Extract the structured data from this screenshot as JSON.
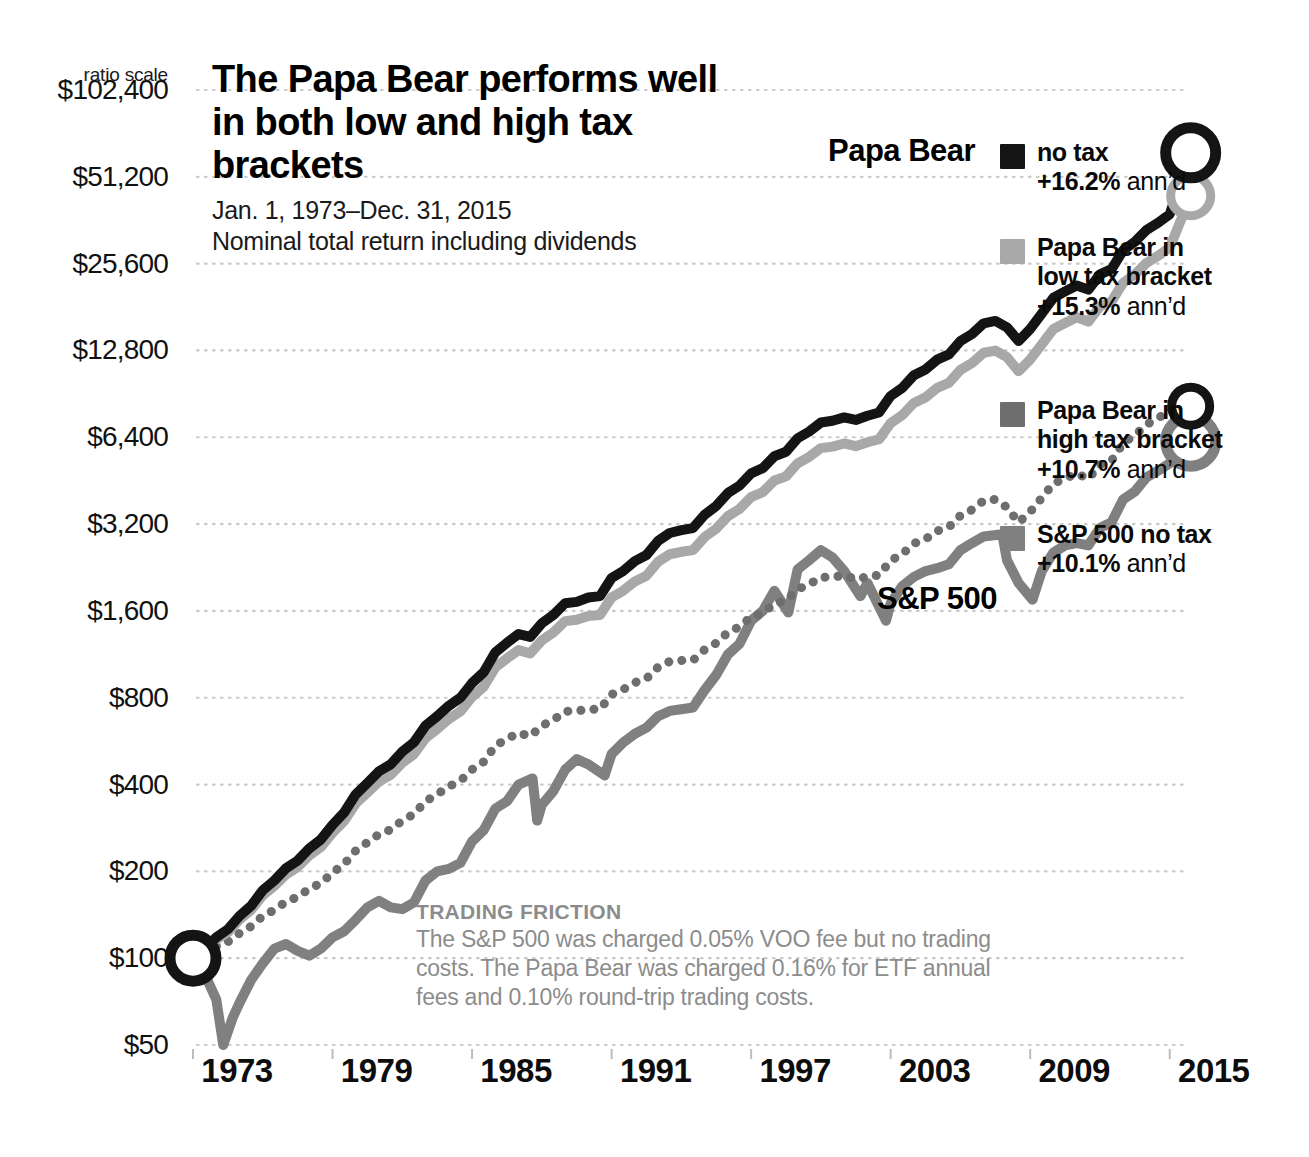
{
  "axis": {
    "ratio_scale_label": "ratio scale",
    "y_ticks": [
      "$102,400",
      "$51,200",
      "$25,600",
      "$12,800",
      "$6,400",
      "$3,200",
      "$1,600",
      "$800",
      "$400",
      "$200",
      "$100",
      "$50"
    ],
    "x_ticks": [
      "1973",
      "1979",
      "1985",
      "1991",
      "1997",
      "2003",
      "2009",
      "2015"
    ]
  },
  "headline": {
    "title": "The Papa Bear performs well in both low and high tax brackets",
    "date_range": "Jan. 1, 1973–Dec. 31, 2015",
    "subnote": "Nominal total return including dividends"
  },
  "callouts": {
    "papa_bear": "Papa Bear",
    "sp500": "S&P 500"
  },
  "legend": {
    "items": [
      {
        "line1": "no tax",
        "line2": null,
        "perf": "+16.2%",
        "ann": " ann’d",
        "color": "#141414"
      },
      {
        "line1": "Papa Bear in",
        "line2": "low tax bracket",
        "perf": "+15.3%",
        "ann": " ann’d",
        "color": "#a8a8a8"
      },
      {
        "line1": "Papa Bear in",
        "line2": "high tax bracket",
        "perf": "+10.7%",
        "ann": " ann’d",
        "color": "#6e6e6e"
      },
      {
        "line1": "S&P 500 no tax",
        "line2": null,
        "perf": "+10.1%",
        "ann": " ann’d",
        "color": "#808080"
      }
    ]
  },
  "friction": {
    "title": "TRADING FRICTION",
    "body": "The S&P 500 was charged 0.05% VOO fee but no trading costs. The Papa Bear was charged 0.16% for ETF annual fees and 0.10% round-trip trading costs."
  },
  "chart_data": {
    "type": "line",
    "title": "The Papa Bear performs well in both low and high tax brackets",
    "subtitle": "Jan. 1, 1973–Dec. 31, 2015 / Nominal total return including dividends",
    "xlabel": "",
    "ylabel": "Growth of $100 (ratio scale)",
    "scale": "log2",
    "grid": true,
    "legend_position": "right",
    "xlim": [
      1973,
      2016
    ],
    "ylim": [
      50,
      102400
    ],
    "y_tick_values": [
      102400,
      51200,
      25600,
      12800,
      6400,
      3200,
      1600,
      800,
      400,
      200,
      100,
      50
    ],
    "x_tick_values": [
      1973,
      1979,
      1985,
      1991,
      1997,
      2003,
      2009,
      2015
    ],
    "annotations": [
      {
        "text": "Papa Bear",
        "x": 2010,
        "y": 76000
      },
      {
        "text": "S&P 500",
        "x": 2009,
        "y": 2300
      },
      {
        "text": "start marker $100",
        "x": 1973,
        "y": 100
      },
      {
        "text": "end marker Papa Bear no tax",
        "x": 2016,
        "y": 62000
      },
      {
        "text": "end marker Papa Bear low tax",
        "x": 2016,
        "y": 44000
      },
      {
        "text": "end marker Papa Bear high tax",
        "x": 2016,
        "y": 8200
      },
      {
        "text": "end marker S&P 500",
        "x": 2016,
        "y": 6200
      }
    ],
    "series": [
      {
        "name": "Papa Bear no tax",
        "annualized_return_pct": 16.2,
        "color": "#141414",
        "style": "solid",
        "x": [
          1973,
          1973.5,
          1974,
          1974.5,
          1975,
          1975.5,
          1976,
          1976.5,
          1977,
          1977.5,
          1978,
          1978.5,
          1979,
          1979.5,
          1980,
          1980.5,
          1981,
          1981.5,
          1982,
          1982.5,
          1983,
          1983.5,
          1984,
          1984.5,
          1985,
          1985.5,
          1986,
          1986.5,
          1987,
          1987.5,
          1988,
          1988.5,
          1989,
          1989.5,
          1990,
          1990.5,
          1991,
          1991.5,
          1992,
          1992.5,
          1993,
          1993.5,
          1994,
          1994.5,
          1995,
          1995.5,
          1996,
          1996.5,
          1997,
          1997.5,
          1998,
          1998.5,
          1999,
          1999.5,
          2000,
          2000.5,
          2001,
          2001.5,
          2002,
          2002.5,
          2003,
          2003.5,
          2004,
          2004.5,
          2005,
          2005.5,
          2006,
          2006.5,
          2007,
          2007.5,
          2008,
          2008.5,
          2009,
          2009.5,
          2010,
          2010.5,
          2011,
          2011.5,
          2012,
          2012.5,
          2013,
          2013.5,
          2014,
          2014.5,
          2015,
          2015.9
        ],
        "y": [
          100,
          108,
          118,
          126,
          140,
          152,
          172,
          186,
          205,
          218,
          240,
          258,
          290,
          320,
          370,
          405,
          445,
          470,
          520,
          560,
          640,
          690,
          750,
          800,
          900,
          980,
          1150,
          1240,
          1330,
          1300,
          1450,
          1550,
          1700,
          1720,
          1780,
          1800,
          2080,
          2200,
          2380,
          2500,
          2800,
          2980,
          3050,
          3100,
          3450,
          3700,
          4100,
          4350,
          4800,
          5000,
          5500,
          5700,
          6350,
          6700,
          7200,
          7300,
          7500,
          7350,
          7600,
          7800,
          8900,
          9500,
          10500,
          11000,
          11900,
          12400,
          13800,
          14600,
          15900,
          16200,
          15400,
          13800,
          15200,
          17200,
          19500,
          20500,
          21500,
          20800,
          23500,
          24500,
          28500,
          30500,
          33500,
          35500,
          38000,
          62000
        ]
      },
      {
        "name": "Papa Bear in low tax bracket",
        "annualized_return_pct": 15.3,
        "color": "#a8a8a8",
        "style": "solid",
        "x": [
          1973,
          1973.5,
          1974,
          1974.5,
          1975,
          1975.5,
          1976,
          1976.5,
          1977,
          1977.5,
          1978,
          1978.5,
          1979,
          1979.5,
          1980,
          1980.5,
          1981,
          1981.5,
          1982,
          1982.5,
          1983,
          1983.5,
          1984,
          1984.5,
          1985,
          1985.5,
          1986,
          1986.5,
          1987,
          1987.5,
          1988,
          1988.5,
          1989,
          1989.5,
          1990,
          1990.5,
          1991,
          1991.5,
          1992,
          1992.5,
          1993,
          1993.5,
          1994,
          1994.5,
          1995,
          1995.5,
          1996,
          1996.5,
          1997,
          1997.5,
          1998,
          1998.5,
          1999,
          1999.5,
          2000,
          2000.5,
          2001,
          2001.5,
          2002,
          2002.5,
          2003,
          2003.5,
          2004,
          2004.5,
          2005,
          2005.5,
          2006,
          2006.5,
          2007,
          2007.5,
          2008,
          2008.5,
          2009,
          2009.5,
          2010,
          2010.5,
          2011,
          2011.5,
          2012,
          2012.5,
          2013,
          2013.5,
          2014,
          2014.5,
          2015,
          2015.9
        ],
        "y": [
          100,
          107,
          116,
          123,
          136,
          147,
          165,
          178,
          195,
          207,
          227,
          243,
          272,
          299,
          344,
          375,
          410,
          432,
          476,
          510,
          580,
          623,
          675,
          718,
          805,
          874,
          1020,
          1095,
          1170,
          1140,
          1265,
          1348,
          1475,
          1490,
          1535,
          1548,
          1782,
          1880,
          2025,
          2120,
          2370,
          2515,
          2565,
          2600,
          2885,
          3085,
          3410,
          3610,
          3970,
          4130,
          4530,
          4685,
          5200,
          5475,
          5870,
          5940,
          6090,
          5960,
          6150,
          6300,
          7170,
          7640,
          8420,
          8800,
          9500,
          9880,
          10960,
          11580,
          12570,
          12790,
          12130,
          10840,
          11900,
          13440,
          15190,
          15940,
          16690,
          16120,
          18180,
          18930,
          21980,
          23480,
          25750,
          27250,
          29100,
          44000
        ]
      },
      {
        "name": "Papa Bear in high tax bracket",
        "annualized_return_pct": 10.7,
        "color": "#6e6e6e",
        "style": "dotted",
        "x": [
          1973,
          1973.5,
          1974,
          1974.5,
          1975,
          1975.5,
          1976,
          1976.5,
          1977,
          1977.5,
          1978,
          1978.5,
          1979,
          1979.5,
          1980,
          1980.5,
          1981,
          1981.5,
          1982,
          1982.5,
          1983,
          1983.5,
          1984,
          1984.5,
          1985,
          1985.5,
          1986,
          1986.5,
          1987,
          1987.5,
          1988,
          1988.5,
          1989,
          1989.5,
          1990,
          1990.5,
          1991,
          1991.5,
          1992,
          1992.5,
          1993,
          1993.5,
          1994,
          1994.5,
          1995,
          1995.5,
          1996,
          1996.5,
          1997,
          1997.5,
          1998,
          1998.5,
          1999,
          1999.5,
          2000,
          2000.5,
          2001,
          2001.5,
          2002,
          2002.5,
          2003,
          2003.5,
          2004,
          2004.5,
          2005,
          2005.5,
          2006,
          2006.5,
          2007,
          2007.5,
          2008,
          2008.5,
          2009,
          2009.5,
          2010,
          2010.5,
          2011,
          2011.5,
          2012,
          2012.5,
          2013,
          2013.5,
          2014,
          2014.5,
          2015,
          2015.9
        ],
        "y": [
          100,
          104,
          110,
          114,
          122,
          129,
          140,
          147,
          157,
          163,
          174,
          182,
          198,
          212,
          236,
          252,
          269,
          279,
          300,
          316,
          350,
          370,
          394,
          412,
          451,
          480,
          545,
          576,
          604,
          588,
          640,
          670,
          718,
          720,
          730,
          729,
          821,
          855,
          903,
          932,
          1022,
          1069,
          1077,
          1079,
          1175,
          1238,
          1348,
          1409,
          1527,
          1570,
          1697,
          1735,
          1901,
          1979,
          2093,
          2096,
          2125,
          2060,
          2102,
          2129,
          2393,
          2520,
          2743,
          2838,
          3031,
          3123,
          3427,
          3589,
          3862,
          3895,
          3660,
          3242,
          3528,
          3948,
          4424,
          4609,
          4790,
          4592,
          5139,
          5312,
          6120,
          6498,
          7086,
          7456,
          7920,
          8200
        ]
      },
      {
        "name": "S&P 500 no tax",
        "annualized_return_pct": 10.1,
        "color": "#808080",
        "style": "solid",
        "x": [
          1973,
          1973.5,
          1974,
          1974.3,
          1974.7,
          1975,
          1975.5,
          1976,
          1976.5,
          1977,
          1977.5,
          1978,
          1978.5,
          1979,
          1979.5,
          1980,
          1980.5,
          1981,
          1981.5,
          1982,
          1982.5,
          1983,
          1983.5,
          1984,
          1984.5,
          1985,
          1985.5,
          1986,
          1986.5,
          1987,
          1987.6,
          1987.8,
          1988,
          1988.5,
          1989,
          1989.5,
          1990,
          1990.7,
          1991,
          1991.5,
          1992,
          1992.5,
          1993,
          1993.5,
          1994,
          1994.5,
          1995,
          1995.5,
          1996,
          1996.5,
          1997,
          1997.5,
          1998,
          1998.6,
          1999,
          1999.5,
          2000,
          2000.5,
          2001,
          2001.7,
          2002,
          2002.8,
          2003,
          2003.5,
          2004,
          2004.5,
          2005,
          2005.5,
          2006,
          2006.5,
          2007,
          2007.8,
          2008,
          2008.5,
          2009.1,
          2009.5,
          2010,
          2010.5,
          2011,
          2011.5,
          2012,
          2012.5,
          2013,
          2013.5,
          2014,
          2014.5,
          2015,
          2015.9
        ],
        "y": [
          100,
          88,
          72,
          50,
          62,
          70,
          84,
          96,
          108,
          112,
          106,
          102,
          108,
          118,
          124,
          136,
          150,
          158,
          150,
          148,
          156,
          186,
          200,
          204,
          214,
          254,
          278,
          330,
          350,
          400,
          420,
          300,
          340,
          380,
          450,
          490,
          470,
          430,
          510,
          560,
          600,
          630,
          690,
          720,
          730,
          740,
          850,
          960,
          1130,
          1230,
          1480,
          1600,
          1880,
          1580,
          2230,
          2400,
          2600,
          2450,
          2200,
          1800,
          2000,
          1480,
          1700,
          1950,
          2100,
          2200,
          2250,
          2320,
          2600,
          2750,
          2900,
          2950,
          2400,
          2000,
          1750,
          2200,
          2550,
          2700,
          2750,
          2700,
          3100,
          3250,
          3900,
          4150,
          4650,
          4900,
          5200,
          6200
        ]
      }
    ]
  }
}
